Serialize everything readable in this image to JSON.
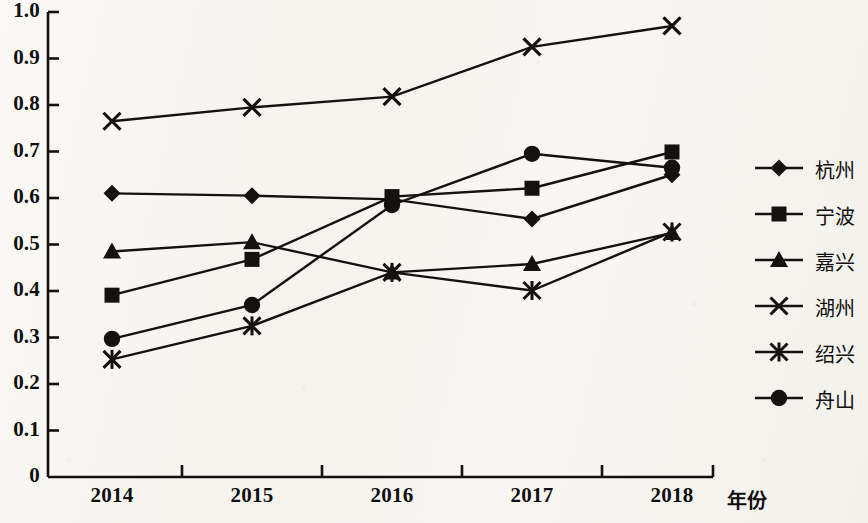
{
  "chart_data": {
    "type": "line",
    "title": "",
    "xlabel": "年份",
    "ylabel": "",
    "categories": [
      "2014",
      "2015",
      "2016",
      "2017",
      "2018"
    ],
    "ylim": [
      0,
      1.0
    ],
    "ytick_step": 0.1,
    "ytick_labels": [
      "0",
      "0.1",
      "0.2",
      "0.3",
      "0.4",
      "0.5",
      "0.6",
      "0.7",
      "0.8",
      "0.9",
      "1.0"
    ],
    "grid": false,
    "legend_position": "right",
    "series": [
      {
        "name": "杭州",
        "marker": "diamond",
        "values": [
          0.61,
          0.605,
          0.597,
          0.555,
          0.65
        ]
      },
      {
        "name": "宁波",
        "marker": "square",
        "values": [
          0.391,
          0.468,
          0.603,
          0.621,
          0.699
        ]
      },
      {
        "name": "嘉兴",
        "marker": "triangle",
        "values": [
          0.485,
          0.505,
          0.44,
          0.458,
          0.525
        ]
      },
      {
        "name": "湖州",
        "marker": "cross",
        "values": [
          0.765,
          0.795,
          0.818,
          0.925,
          0.97
        ]
      },
      {
        "name": "绍兴",
        "marker": "asterisk",
        "values": [
          0.253,
          0.325,
          0.44,
          0.401,
          0.527
        ]
      },
      {
        "name": "舟山",
        "marker": "circle",
        "values": [
          0.297,
          0.37,
          0.585,
          0.695,
          0.665
        ]
      }
    ]
  },
  "colors": {
    "ink": "#141210",
    "paper": "#f7f6f2"
  }
}
